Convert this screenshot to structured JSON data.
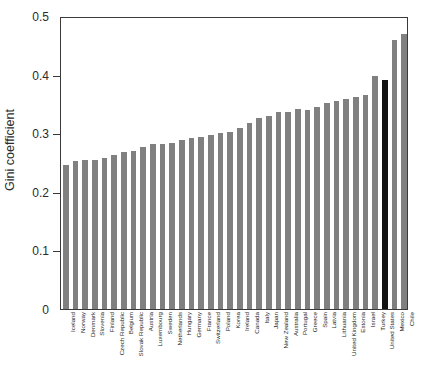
{
  "chart_data": {
    "type": "bar",
    "title": "",
    "xlabel": "",
    "ylabel": "Gini coefficient",
    "ylim": [
      0,
      0.5
    ],
    "ytick_labels": [
      "0",
      "0.1",
      "0.2",
      "0.3",
      "0.4",
      "0.5"
    ],
    "ytick_values": [
      0,
      0.1,
      0.2,
      0.3,
      0.4,
      0.5
    ],
    "grid": false,
    "legend": null,
    "bar_color": "#808080",
    "highlight_color": "#121212",
    "highlight_category": "United States",
    "categories": [
      "Iceland",
      "Norway",
      "Denmark",
      "Slovenia",
      "Finland",
      "Czech Republic",
      "Belgium",
      "Slovak Republic",
      "Austria",
      "Luxembourg",
      "Sweden",
      "Netherlands",
      "Hungary",
      "Germany",
      "France",
      "Switzerland",
      "Poland",
      "Korea",
      "Ireland",
      "Canada",
      "Italy",
      "Japan",
      "New Zealand",
      "Australia",
      "Portugal",
      "Greece",
      "Spain",
      "Latvia",
      "Lithuania",
      "United Kingdom",
      "Estonia",
      "Israel",
      "Turkey",
      "United States",
      "Mexico",
      "Chile"
    ],
    "values": [
      0.246,
      0.252,
      0.254,
      0.255,
      0.257,
      0.262,
      0.268,
      0.269,
      0.276,
      0.281,
      0.281,
      0.283,
      0.288,
      0.292,
      0.294,
      0.297,
      0.3,
      0.302,
      0.309,
      0.318,
      0.326,
      0.33,
      0.337,
      0.337,
      0.341,
      0.34,
      0.345,
      0.352,
      0.355,
      0.358,
      0.361,
      0.365,
      0.398,
      0.39,
      0.459,
      0.47
    ]
  }
}
